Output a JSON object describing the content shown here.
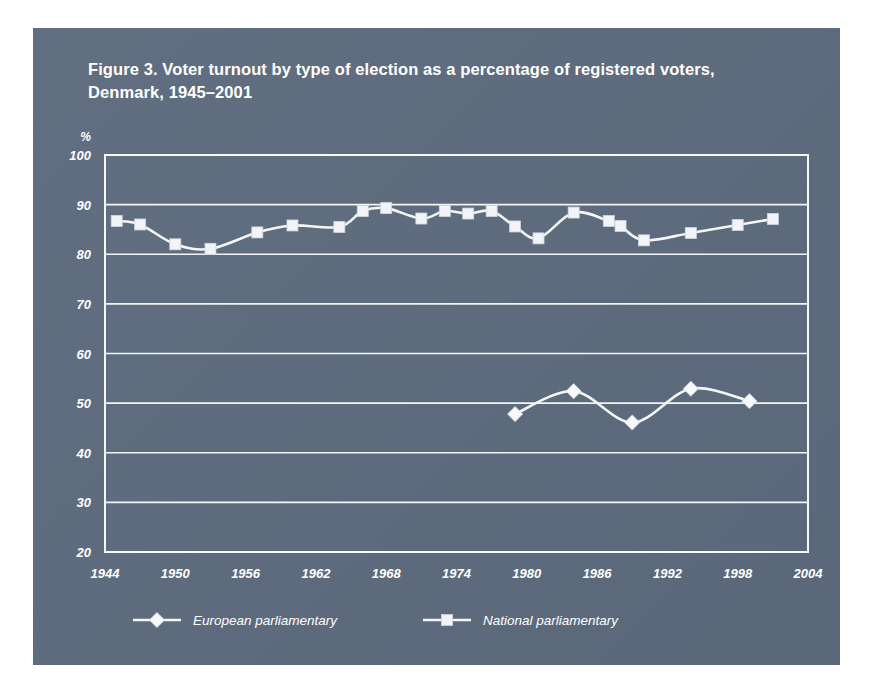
{
  "figure": {
    "title": "Figure 3. Voter turnout by type of election as a percentage of registered voters, Denmark, 1945–2001",
    "panel_color": "#5d6b7e",
    "ink_color": "#f4f6f8"
  },
  "chart_data": {
    "type": "line",
    "title": "Figure 3. Voter turnout by type of election as a percentage of registered voters, Denmark, 1945–2001",
    "xlabel": "",
    "ylabel": "%",
    "unit_label": "%",
    "xlim": [
      1944,
      2004
    ],
    "ylim": [
      20,
      100
    ],
    "xticks": [
      1944,
      1950,
      1956,
      1962,
      1968,
      1974,
      1980,
      1986,
      1992,
      1998,
      2004
    ],
    "xticklabels": [
      "1944",
      "1950",
      "1956",
      "1962",
      "1968",
      "1974",
      "1980",
      "1986",
      "1992",
      "1998",
      "2004"
    ],
    "yticks": [
      20,
      30,
      40,
      50,
      60,
      70,
      80,
      90,
      100
    ],
    "yticklabels": [
      "20",
      "30",
      "40",
      "50",
      "60",
      "70",
      "80",
      "90",
      "100"
    ],
    "grid": true,
    "grid_axis": "y",
    "legend_position": "bottom",
    "series": [
      {
        "name": "European parliamentary",
        "marker": "diamond",
        "points": [
          {
            "x": 1979,
            "y": 47.8
          },
          {
            "x": 1984,
            "y": 52.4
          },
          {
            "x": 1989,
            "y": 46.1
          },
          {
            "x": 1994,
            "y": 52.9
          },
          {
            "x": 1999,
            "y": 50.4
          }
        ]
      },
      {
        "name": "National parliamentary",
        "marker": "square",
        "points": [
          {
            "x": 1945,
            "y": 86.7
          },
          {
            "x": 1947,
            "y": 86.0
          },
          {
            "x": 1950,
            "y": 82.0
          },
          {
            "x": 1953,
            "y": 81.1
          },
          {
            "x": 1957,
            "y": 84.4
          },
          {
            "x": 1960,
            "y": 85.8
          },
          {
            "x": 1964,
            "y": 85.5
          },
          {
            "x": 1966,
            "y": 88.7
          },
          {
            "x": 1968,
            "y": 89.3
          },
          {
            "x": 1971,
            "y": 87.2
          },
          {
            "x": 1973,
            "y": 88.7
          },
          {
            "x": 1975,
            "y": 88.2
          },
          {
            "x": 1977,
            "y": 88.7
          },
          {
            "x": 1979,
            "y": 85.6
          },
          {
            "x": 1981,
            "y": 83.2
          },
          {
            "x": 1984,
            "y": 88.4
          },
          {
            "x": 1987,
            "y": 86.7
          },
          {
            "x": 1988,
            "y": 85.7
          },
          {
            "x": 1990,
            "y": 82.8
          },
          {
            "x": 1994,
            "y": 84.3
          },
          {
            "x": 1998,
            "y": 85.9
          },
          {
            "x": 2001,
            "y": 87.1
          }
        ]
      }
    ]
  },
  "legend": {
    "items": [
      {
        "label": "European parliamentary",
        "marker": "diamond"
      },
      {
        "label": "National parliamentary",
        "marker": "square"
      }
    ]
  }
}
